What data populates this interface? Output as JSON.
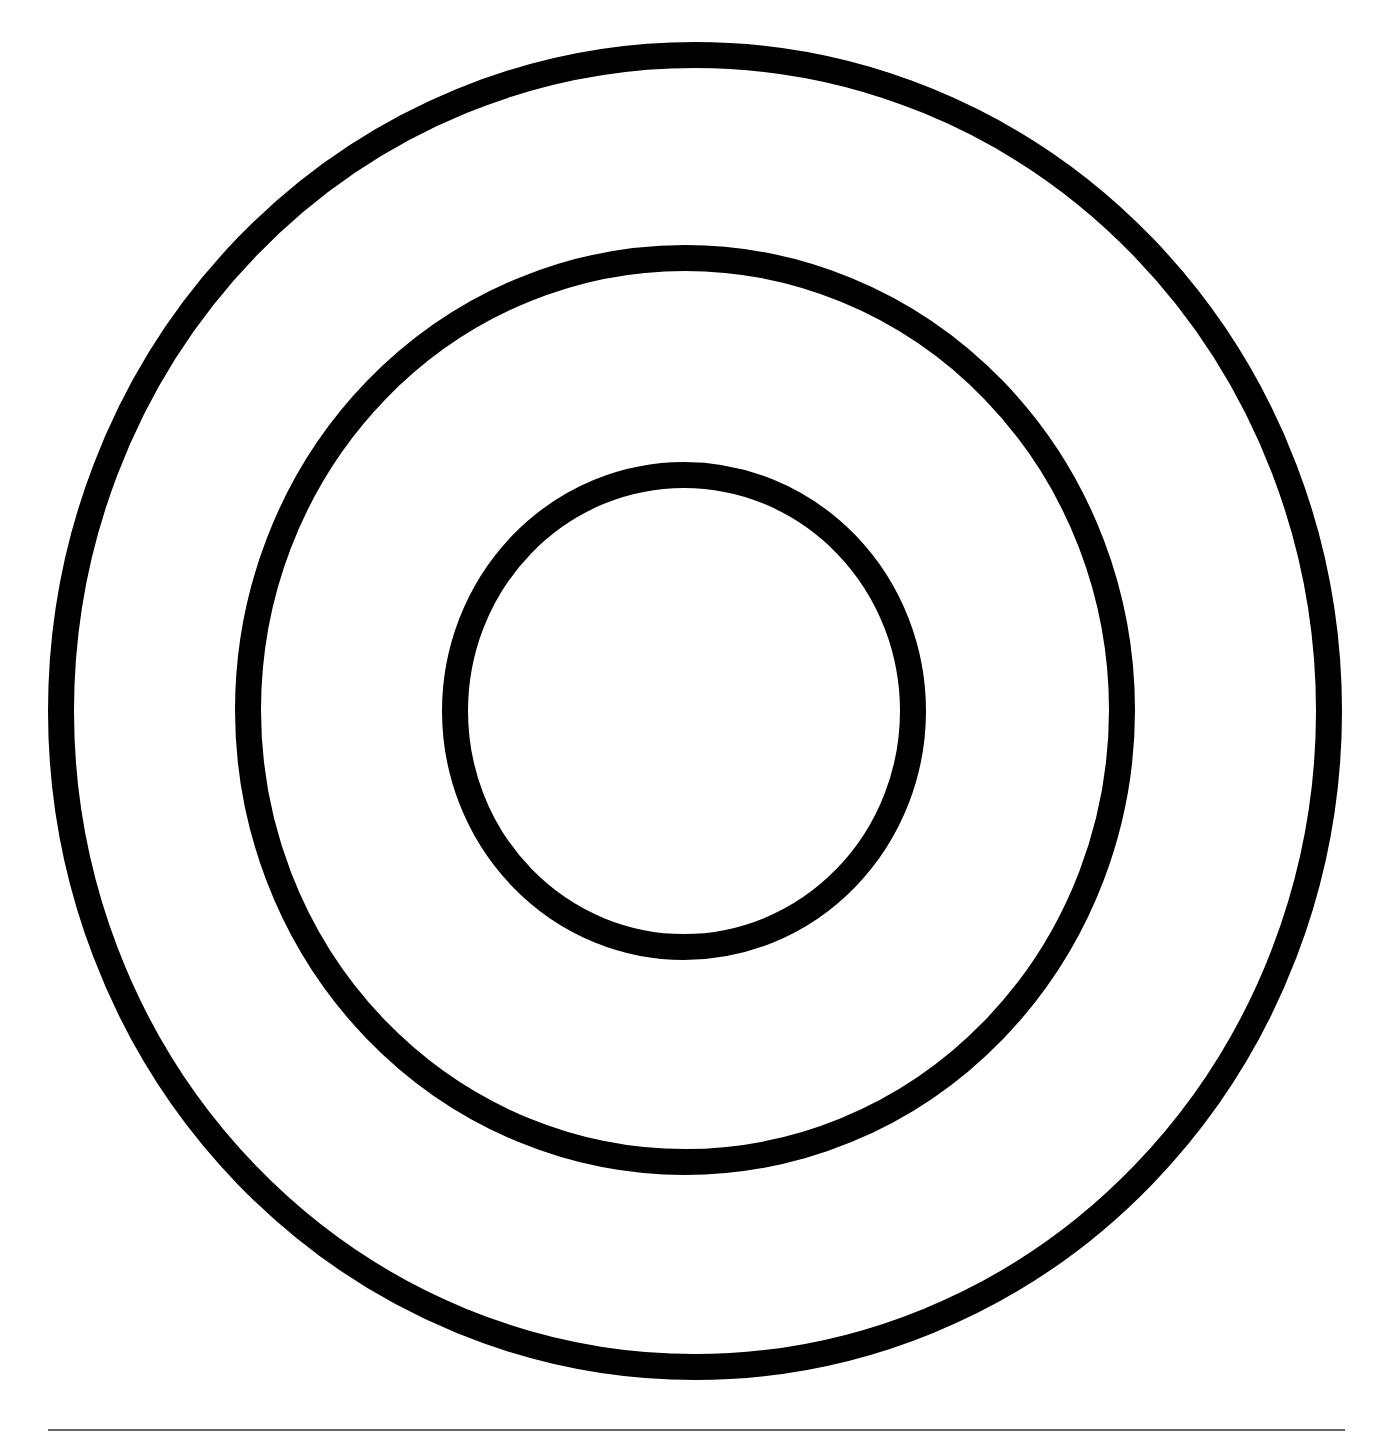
{
  "figure": {
    "type": "concentric-circles",
    "background": "#ffffff",
    "stroke_color": "#000000",
    "rings": [
      {
        "name": "outer-ring",
        "cx": 695,
        "cy": 711,
        "rx": 634,
        "ry": 656,
        "stroke_width": 26
      },
      {
        "name": "middle-ring",
        "cx": 685,
        "cy": 710,
        "rx": 437,
        "ry": 452,
        "stroke_width": 26
      },
      {
        "name": "inner-ring",
        "cx": 684,
        "cy": 711,
        "rx": 229,
        "ry": 236,
        "stroke_width": 26
      }
    ],
    "baseline": {
      "x1": 48,
      "x2": 1345,
      "y": 1430,
      "color": "#333333",
      "width": 1.5
    }
  }
}
